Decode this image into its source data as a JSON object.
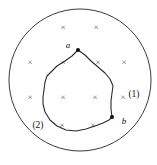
{
  "figure": {
    "background_color": "#ffffff",
    "stroke_color": "#2b2b2b",
    "field_symbol_color": "#5a5a5a"
  },
  "boundary": {
    "shape": "circle",
    "center_x": 80,
    "center_y": 80,
    "radius": 71,
    "meaning": "region-of-magnetic-field"
  },
  "field": {
    "symbol": "×",
    "direction": "into-page",
    "count": 12,
    "markers": [
      {
        "x": 63,
        "y": 28
      },
      {
        "x": 96,
        "y": 28
      },
      {
        "x": 30,
        "y": 63
      },
      {
        "x": 63,
        "y": 63
      },
      {
        "x": 98,
        "y": 63
      },
      {
        "x": 124,
        "y": 63
      },
      {
        "x": 30,
        "y": 98
      },
      {
        "x": 63,
        "y": 98
      },
      {
        "x": 95,
        "y": 98
      },
      {
        "x": 123,
        "y": 98
      },
      {
        "x": 62,
        "y": 126
      },
      {
        "x": 93,
        "y": 126
      }
    ]
  },
  "loop": {
    "name": "closed-irregular-loop",
    "outline": "M 78 50 L 72 56 L 65 61 L 57 66 L 52 71 L 47 76 L 45 82 L 44 90 L 43 97 L 43 104 L 45 112 L 50 120 L 57 126 L 66 130 L 76 131 L 86 129 L 95 126 L 103 123 L 109 120 L 112 117 L 111 109 L 111 101 L 112 93 L 113 86 L 110 79 L 105 73 L 98 67 L 91 61 L 85 55 Z"
  },
  "nodes": [
    {
      "id": "a",
      "label": "a",
      "x": 78,
      "y": 50,
      "label_x": 68,
      "label_y": 46
    },
    {
      "id": "b",
      "label": "b",
      "x": 112,
      "y": 117,
      "label_x": 124,
      "label_y": 122
    }
  ],
  "path_labels": [
    {
      "id": "path-1",
      "label": "(1)",
      "x": 134,
      "y": 95
    },
    {
      "id": "path-2",
      "label": "(2)",
      "x": 38,
      "y": 126
    }
  ]
}
